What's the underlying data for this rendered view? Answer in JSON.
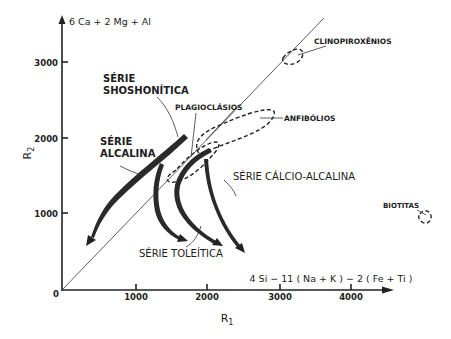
{
  "diagram": {
    "y_axis": {
      "label": "R",
      "label_sub": "2",
      "formula": "6 Ca + 2 Mg + Al",
      "ticks": [
        "1000",
        "2000",
        "3000"
      ]
    },
    "x_axis": {
      "label": "R",
      "label_sub": "1",
      "formula": "4 Si − 11 ( Na + K ) − 2 ( Fe + Ti )",
      "origin": "0",
      "ticks": [
        "1000",
        "2000",
        "3000",
        "4000"
      ]
    },
    "series_labels": {
      "shoshonitica_line1": "SÉRIE",
      "shoshonitica_line2": "SHOSHONÍTICA",
      "alcalina_line1": "SÉRIE",
      "alcalina_line2": "ALCALINA",
      "toleitica": "SÉRIE  TOLEÍTICA",
      "calcio_alcalina": "SÉRIE  CÁLCIO-ALCALINA"
    },
    "mineral_labels": {
      "plagioclasios": "PLAGIOCLÁSIOS",
      "anfibolios": "ANFIBÓLIOS",
      "clinopiroxenios": "CLINOPIROXÊNIOS",
      "biotitas": "BIOTITAS"
    },
    "colors": {
      "ink": "#222222",
      "background": "#ffffff"
    }
  }
}
